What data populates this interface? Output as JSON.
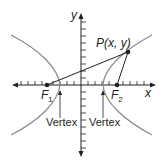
{
  "diagram": {
    "type": "hyperbola",
    "axes": {
      "x_label": "x",
      "y_label": "y"
    },
    "point_label": "P(x, y)",
    "foci": [
      {
        "name": "F",
        "sub": "1"
      },
      {
        "name": "F",
        "sub": "2"
      }
    ],
    "vertex_labels": [
      "Vertex",
      "Vertex"
    ],
    "colors": {
      "curve": "#8a8a8a",
      "axes": "#231f20",
      "text": "#231f20"
    }
  }
}
